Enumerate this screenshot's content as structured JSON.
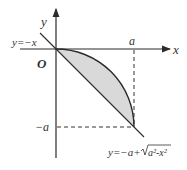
{
  "diagram": {
    "title": "",
    "axes": {
      "x_label": "x",
      "y_label": "y",
      "origin_label": "O"
    },
    "tick_labels": {
      "a_on_x": "a",
      "neg_a_on_y": "−a"
    },
    "curves": {
      "line_label": "y=−x",
      "arc_label_prefix": "y=−a+",
      "arc_label_radicand": "a²-x²"
    },
    "shaded_region": "area between y=−x and y=−a+√(a²−x²) for 0≤x≤a",
    "colors": {
      "axis": "#2b2b2b",
      "shade": "#d9d9d9",
      "dash": "#333333"
    }
  }
}
